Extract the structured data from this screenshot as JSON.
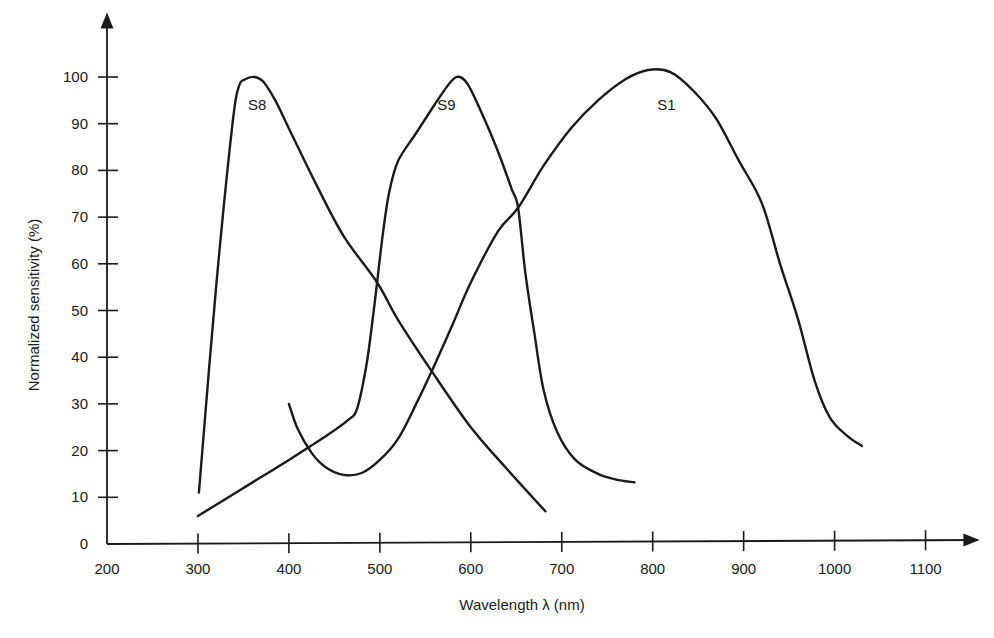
{
  "chart_data": {
    "type": "line",
    "title": "",
    "xlabel": "Wavelength λ (nm)",
    "ylabel": "Normalized sensitivity (%)",
    "xlim": [
      200,
      1150
    ],
    "ylim": [
      0,
      110
    ],
    "x_ticks": [
      200,
      300,
      400,
      500,
      600,
      700,
      800,
      900,
      1000,
      1100
    ],
    "y_ticks": [
      0,
      10,
      20,
      30,
      40,
      50,
      60,
      70,
      80,
      90,
      100
    ],
    "grid": false,
    "legend": "inline labels near curve peaks",
    "series": [
      {
        "name": "S8",
        "label_pos": [
          355,
          93
        ],
        "points": [
          [
            301,
            11
          ],
          [
            320,
            55
          ],
          [
            338,
            90
          ],
          [
            345,
            98
          ],
          [
            352,
            99.5
          ],
          [
            362,
            100
          ],
          [
            372,
            99
          ],
          [
            385,
            95
          ],
          [
            400,
            89
          ],
          [
            430,
            77
          ],
          [
            460,
            66
          ],
          [
            497,
            56
          ],
          [
            520,
            48
          ],
          [
            557,
            37
          ],
          [
            600,
            25
          ],
          [
            640,
            16
          ],
          [
            682,
            7
          ]
        ]
      },
      {
        "name": "S9",
        "label_pos": [
          563,
          93
        ],
        "points": [
          [
            300,
            6
          ],
          [
            350,
            12
          ],
          [
            400,
            18
          ],
          [
            440,
            23
          ],
          [
            465,
            26.5
          ],
          [
            475,
            29
          ],
          [
            485,
            38
          ],
          [
            492,
            48
          ],
          [
            497,
            56
          ],
          [
            503,
            66
          ],
          [
            510,
            75
          ],
          [
            520,
            82
          ],
          [
            540,
            88
          ],
          [
            560,
            94
          ],
          [
            578,
            99
          ],
          [
            588,
            100
          ],
          [
            598,
            98
          ],
          [
            615,
            91
          ],
          [
            630,
            84
          ],
          [
            645,
            76
          ],
          [
            652,
            72
          ],
          [
            660,
            58
          ],
          [
            670,
            45
          ],
          [
            680,
            33
          ],
          [
            695,
            24
          ],
          [
            715,
            18
          ],
          [
            740,
            15
          ],
          [
            760,
            13.8
          ],
          [
            780,
            13.2
          ]
        ]
      },
      {
        "name": "S1",
        "label_pos": [
          805,
          93
        ],
        "points": [
          [
            400,
            30
          ],
          [
            410,
            24.5
          ],
          [
            425,
            19.5
          ],
          [
            440,
            16.5
          ],
          [
            460,
            14.8
          ],
          [
            480,
            15.2
          ],
          [
            500,
            18
          ],
          [
            520,
            22.5
          ],
          [
            540,
            30
          ],
          [
            557,
            37
          ],
          [
            580,
            47
          ],
          [
            600,
            56
          ],
          [
            630,
            67
          ],
          [
            652,
            72
          ],
          [
            680,
            81
          ],
          [
            710,
            89
          ],
          [
            740,
            95
          ],
          [
            770,
            99.5
          ],
          [
            795,
            101.5
          ],
          [
            820,
            101
          ],
          [
            845,
            97
          ],
          [
            870,
            91
          ],
          [
            895,
            82
          ],
          [
            920,
            73
          ],
          [
            940,
            60
          ],
          [
            960,
            48
          ],
          [
            978,
            35
          ],
          [
            995,
            27
          ],
          [
            1015,
            23
          ],
          [
            1030,
            21
          ]
        ]
      }
    ],
    "annotations": [
      "S8",
      "S9",
      "S1"
    ]
  }
}
